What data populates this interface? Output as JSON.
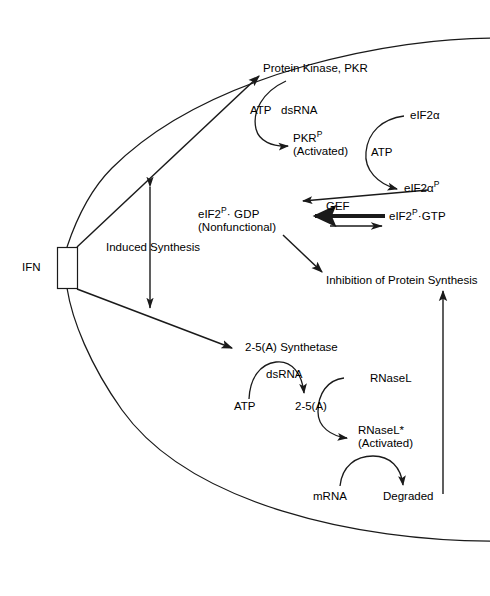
{
  "figure": {
    "cell_boundary_name": "cell-membrane",
    "line_color": "#1a1a1a",
    "background_color": "#ffffff"
  },
  "nodes": {
    "ifn": "IFN",
    "induced_synthesis": "Induced Synthesis",
    "protein_kinase_pkr": "Protein Kinase, PKR",
    "atp_pkr": "ATP",
    "dsrna_pkr": "dsRNA",
    "pkr_activated_main": "PKR",
    "pkr_activated_sup": "P",
    "pkr_activated_sub": "(Activated)",
    "eif2a": "eIF2α",
    "atp_eif2": "ATP",
    "eif2a_p_main": "eIF2α",
    "eif2a_p_sup": "P",
    "eif2_gdp_pre": "eIF2",
    "eif2_gdp_sup": "P",
    "eif2_gdp_post": "· GDP",
    "eif2_gdp_sub": "(Nonfunctional)",
    "gef": "GEF",
    "eif2_gtp_pre": "eIF2",
    "eif2_gtp_sup": "P",
    "eif2_gtp_post": "·GTP",
    "inhibition": "Inhibition of Protein Synthesis",
    "synthetase": "2-5(A) Synthetase",
    "atp_synth": "ATP",
    "dsrna_synth": "dsRNA",
    "two_five_a": "2-5(A)",
    "rnasel": "RNaseL",
    "rnasel_activated_main": "RNaseL*",
    "rnasel_activated_sub": "(Activated)",
    "mrna": "mRNA",
    "degraded": "Degraded"
  },
  "edges": [
    {
      "name": "ifn-to-pkr",
      "from": "IFN",
      "to": "Protein Kinase, PKR",
      "style": "straight-arrow"
    },
    {
      "name": "ifn-to-synthetase",
      "from": "IFN",
      "to": "2-5(A) Synthetase",
      "style": "straight-arrow"
    },
    {
      "name": "induced-synthesis-double",
      "from": "Induced Synthesis",
      "to": "both pathways",
      "style": "double-headed-arrow"
    },
    {
      "name": "pkr-activation-arc",
      "from": "Protein Kinase, PKR",
      "to": "PKR-P (Activated)",
      "style": "curved-arrow",
      "cofactors": [
        "ATP",
        "dsRNA"
      ]
    },
    {
      "name": "eif2a-phosphorylation-arc",
      "from": "eIF2α",
      "to": "eIF2α-P",
      "style": "curved-arrow",
      "cofactors": [
        "ATP"
      ]
    },
    {
      "name": "eif2ap-to-eif2gdp",
      "from": "eIF2α-P",
      "to": "eIF2-P·GDP",
      "style": "straight-arrow"
    },
    {
      "name": "gef-exchange-reverse",
      "from": "eIF2-P·GTP",
      "to": "eIF2-P·GDP",
      "style": "thick-arrow",
      "label": "GEF"
    },
    {
      "name": "gef-exchange-forward",
      "from": "eIF2-P·GDP",
      "to": "eIF2-P·GTP",
      "style": "thin-arrow"
    },
    {
      "name": "eif2gdp-to-inhibition",
      "from": "eIF2-P·GDP (Nonfunctional)",
      "to": "Inhibition of Protein Synthesis",
      "style": "straight-arrow"
    },
    {
      "name": "synthetase-arc",
      "from": "ATP",
      "to": "2-5(A)",
      "style": "curved-arrow",
      "cofactors": [
        "dsRNA"
      ]
    },
    {
      "name": "rnasel-activation-arc",
      "from": "RNaseL",
      "to": "RNaseL* (Activated)",
      "style": "curved-arrow",
      "cofactors": [
        "2-5(A)"
      ]
    },
    {
      "name": "mrna-degradation-arc",
      "from": "mRNA",
      "to": "Degraded",
      "style": "curved-arrow",
      "cofactors": [
        "RNaseL* (Activated)"
      ]
    },
    {
      "name": "degraded-to-inhibition",
      "from": "Degraded",
      "to": "Inhibition of Protein Synthesis",
      "style": "long-vertical-arrow"
    }
  ]
}
